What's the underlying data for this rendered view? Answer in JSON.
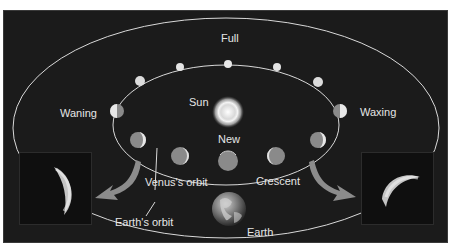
{
  "diagram": {
    "labels": {
      "full": "Full",
      "sun": "Sun",
      "new": "New",
      "waning": "Waning",
      "waxing": "Waxing",
      "crescent": "Crescent",
      "venus_orbit": "Venus's orbit",
      "earth_orbit": "Earth's orbit",
      "earth": "Earth"
    },
    "colors": {
      "background": "#1b1b1b",
      "orbit_line": "#d9d9d9",
      "venus_lit": "#e8e8e8",
      "venus_dark": "#8a8a8a",
      "arrow": "#8c8c8c",
      "sun": "#f2f2f2"
    },
    "insets": [
      {
        "name": "waning-crescent-photo",
        "position": "left"
      },
      {
        "name": "waxing-crescent-photo",
        "position": "right"
      }
    ]
  }
}
